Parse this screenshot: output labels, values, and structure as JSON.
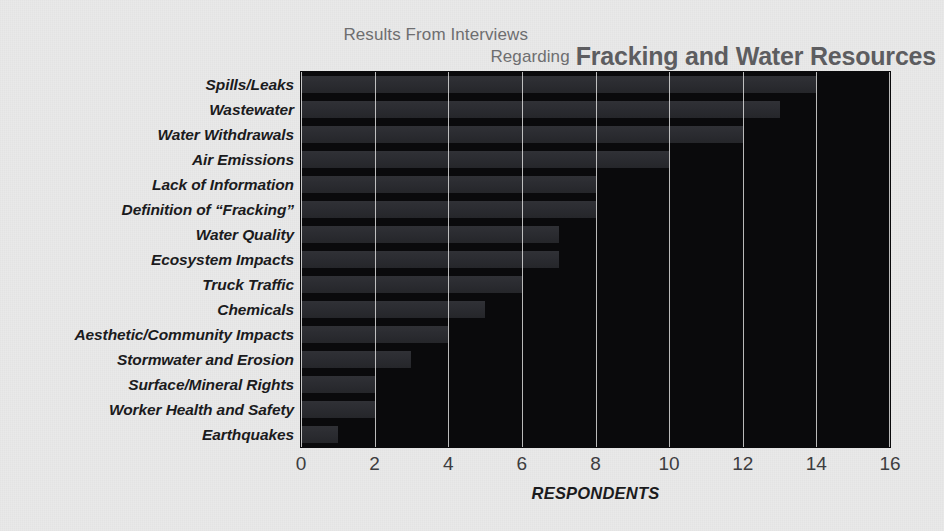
{
  "header": {
    "kicker_line1": "Results From Interviews",
    "kicker_line2": "Regarding",
    "title": "Fracking and Water Resources"
  },
  "chart_data": {
    "type": "bar",
    "orientation": "horizontal",
    "title": "Fracking and Water Resources",
    "subtitle": "Results From Interviews Regarding",
    "xlabel": "RESPONDENTS",
    "ylabel": "",
    "xlim": [
      0,
      16
    ],
    "xticks": [
      "0",
      "2",
      "4",
      "6",
      "8",
      "10",
      "12",
      "14",
      "16"
    ],
    "xtick_values": [
      0,
      2,
      4,
      6,
      8,
      10,
      12,
      14,
      16
    ],
    "grid": true,
    "legend": "none",
    "categories": [
      "Spills/Leaks",
      "Wastewater",
      "Water Withdrawals",
      "Air Emissions",
      "Lack of Information",
      "Definition of “Fracking”",
      "Water Quality",
      "Ecosystem Impacts",
      "Truck Traffic",
      "Chemicals",
      "Aesthetic/Community Impacts",
      "Stormwater and Erosion",
      "Surface/Mineral Rights",
      "Worker Health and Safety",
      "Earthquakes"
    ],
    "values": [
      14,
      13,
      12,
      10,
      8,
      8,
      7,
      7,
      6,
      5,
      4,
      3,
      2,
      2,
      1
    ]
  },
  "colors": {
    "page_background": "#e9e9e9",
    "plot_background": "#0a0a0c",
    "bar_fill": "#2b2c31",
    "gridline": "#d9d9d9",
    "label_text": "#1b1b1d",
    "tick_text": "#3d3d40",
    "title_text": "#5d5d60",
    "kicker_text": "#6e6e70"
  }
}
